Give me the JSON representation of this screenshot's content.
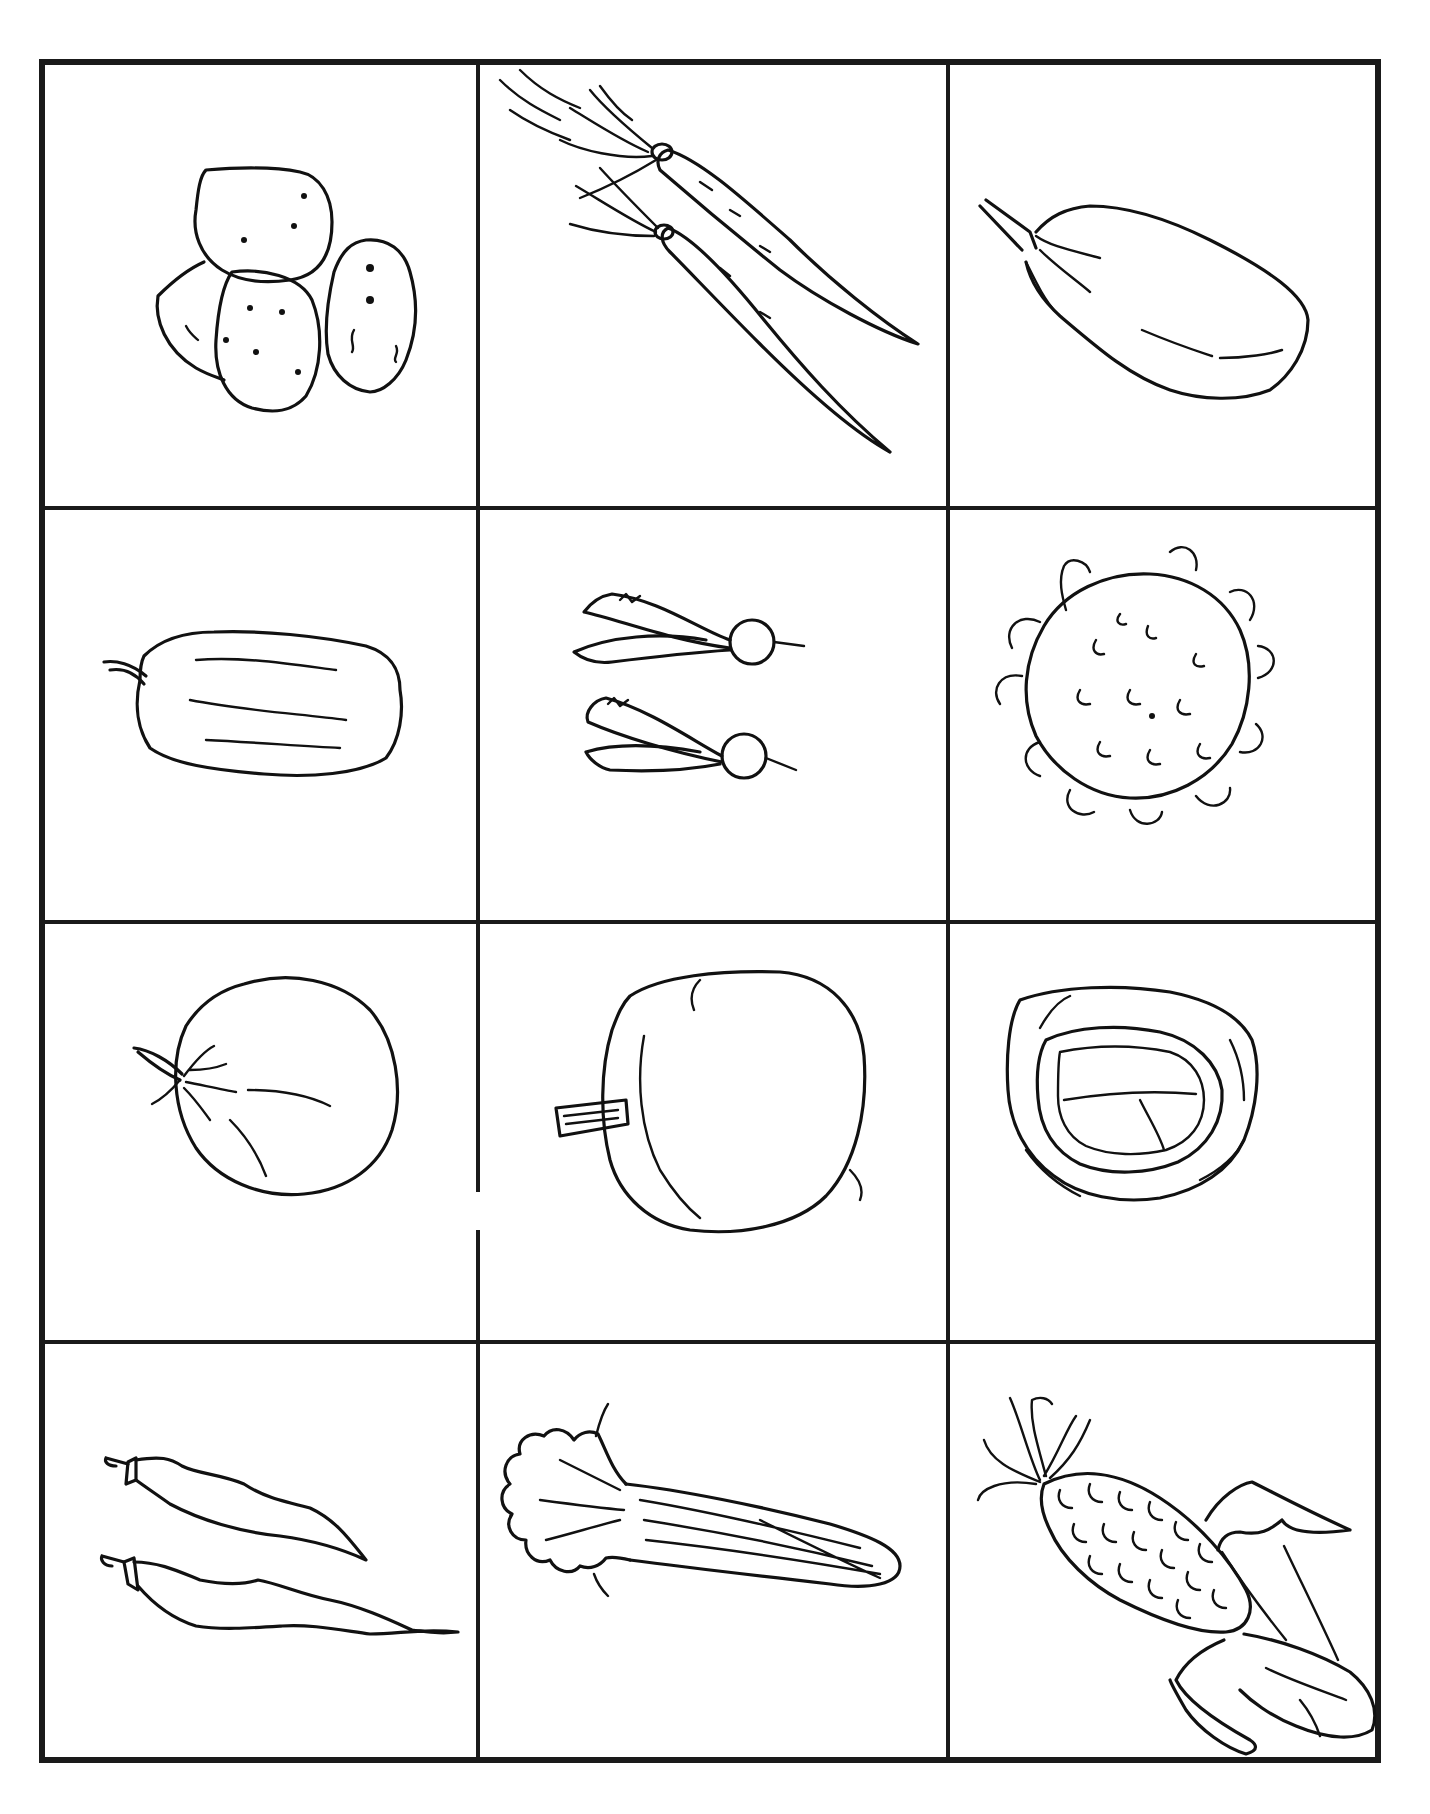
{
  "worksheet": {
    "layout": {
      "rows": 4,
      "columns": 3
    },
    "cells": [
      {
        "row": 1,
        "col": 1,
        "label": "Potatoes",
        "icon": "potatoes-icon"
      },
      {
        "row": 1,
        "col": 2,
        "label": "Carrots",
        "icon": "carrots-icon"
      },
      {
        "row": 1,
        "col": 3,
        "label": "Eggplant",
        "icon": "eggplant-icon"
      },
      {
        "row": 2,
        "col": 1,
        "label": "Bell pepper",
        "icon": "bell-pepper-icon"
      },
      {
        "row": 2,
        "col": 2,
        "label": "Radishes",
        "icon": "radishes-icon"
      },
      {
        "row": 2,
        "col": 3,
        "label": "Cauliflower",
        "icon": "cauliflower-icon"
      },
      {
        "row": 3,
        "col": 1,
        "label": "Tomato",
        "icon": "tomato-icon"
      },
      {
        "row": 3,
        "col": 2,
        "label": "Pumpkin",
        "icon": "pumpkin-icon"
      },
      {
        "row": 3,
        "col": 3,
        "label": "Cabbage",
        "icon": "cabbage-icon"
      },
      {
        "row": 4,
        "col": 1,
        "label": "Green beans",
        "icon": "green-beans-icon"
      },
      {
        "row": 4,
        "col": 2,
        "label": "Celery",
        "icon": "celery-icon"
      },
      {
        "row": 4,
        "col": 3,
        "label": "Corn",
        "icon": "corn-icon"
      }
    ],
    "colors": {
      "ink": "#111111",
      "paper": "#ffffff"
    }
  }
}
